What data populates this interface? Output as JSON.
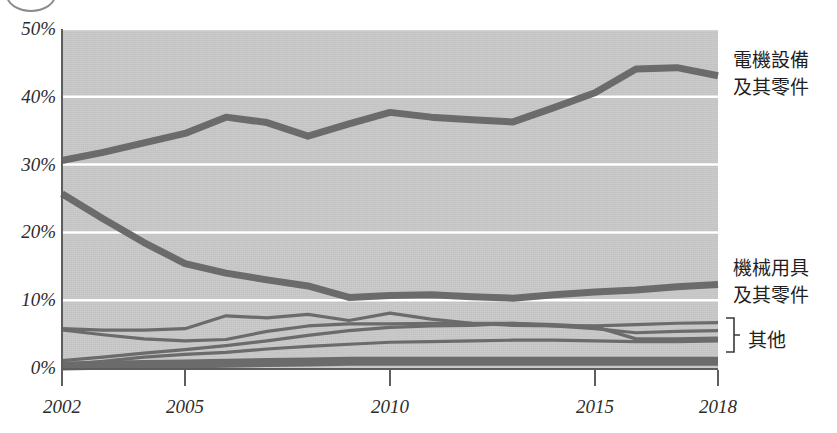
{
  "figure": {
    "marker": "circle-partial"
  },
  "axes": {
    "y_ticks": [
      "50%",
      "40%",
      "30%",
      "20%",
      "10%",
      "0%"
    ],
    "y_values": [
      50,
      40,
      30,
      20,
      10,
      0
    ],
    "x_ticks": [
      "2002",
      "2005",
      "2010",
      "2015",
      "2018"
    ],
    "x_values": [
      2002,
      2005,
      2010,
      2015,
      2018
    ]
  },
  "labels": {
    "electrical_line1": "電機設備",
    "electrical_line2": "及其零件",
    "machinery_line1": "機械用具",
    "machinery_line2": "及其零件",
    "other": "其他"
  },
  "colors": {
    "plot_background": "#c8c8c8",
    "gridline": "#ffffff",
    "line": "#6b6b6b",
    "axis": "#5e5e5e",
    "text": "#1f1f1f"
  },
  "chart_data": {
    "type": "line",
    "title": "",
    "xlabel": "",
    "ylabel": "",
    "xlim": [
      2002,
      2018
    ],
    "ylim": [
      0,
      50
    ],
    "grid": "horizontal",
    "legend_position": "right",
    "x": [
      2002,
      2003,
      2004,
      2005,
      2006,
      2007,
      2008,
      2009,
      2010,
      2011,
      2012,
      2013,
      2014,
      2015,
      2016,
      2017,
      2018
    ],
    "series": [
      {
        "name": "電機設備及其零件",
        "label": "電機設備\n及其零件",
        "width": "thick",
        "values": [
          30.6,
          31.8,
          33.2,
          34.6,
          37.0,
          36.2,
          34.2,
          36.0,
          37.7,
          37.0,
          36.6,
          36.3,
          38.4,
          40.6,
          44.1,
          44.3,
          43.1
        ]
      },
      {
        "name": "機械用具及其零件",
        "label": "機械用具\n及其零件",
        "width": "thick",
        "values": [
          25.7,
          22.0,
          18.5,
          15.4,
          14.0,
          13.0,
          12.1,
          10.4,
          10.7,
          10.8,
          10.5,
          10.3,
          10.8,
          11.2,
          11.5,
          12.0,
          12.3
        ]
      },
      {
        "name": "其他-1",
        "label": "其他",
        "width": "thin",
        "values": [
          5.8,
          5.6,
          5.6,
          5.8,
          7.7,
          7.4,
          7.9,
          7.0,
          8.1,
          7.2,
          6.6,
          6.3,
          6.2,
          6.2,
          6.4,
          6.6,
          6.7
        ]
      },
      {
        "name": "其他-2",
        "label": "其他",
        "width": "thin",
        "values": [
          5.6,
          4.9,
          4.3,
          4.0,
          4.2,
          5.4,
          6.2,
          6.5,
          6.5,
          6.6,
          6.6,
          6.6,
          6.2,
          5.8,
          5.2,
          5.4,
          5.5
        ]
      },
      {
        "name": "其他-3",
        "label": "其他",
        "width": "thin",
        "values": [
          1.1,
          1.6,
          2.2,
          2.7,
          3.3,
          4.0,
          4.8,
          5.5,
          6.0,
          6.2,
          6.3,
          6.6,
          6.4,
          6.1,
          4.3,
          4.3,
          4.4
        ]
      },
      {
        "name": "其他-4",
        "label": "其他",
        "width": "thin",
        "values": [
          0.5,
          1.0,
          1.6,
          2.0,
          2.3,
          2.8,
          3.2,
          3.5,
          3.8,
          3.9,
          4.0,
          4.1,
          4.1,
          4.0,
          3.9,
          3.9,
          4.0
        ]
      },
      {
        "name": "其他-5",
        "label": "其他",
        "width": "thick-base",
        "values": [
          0.3,
          0.4,
          0.5,
          0.6,
          0.7,
          0.8,
          0.9,
          1.0,
          1.0,
          1.0,
          1.0,
          1.0,
          1.0,
          1.0,
          1.0,
          1.0,
          1.0
        ]
      }
    ]
  }
}
